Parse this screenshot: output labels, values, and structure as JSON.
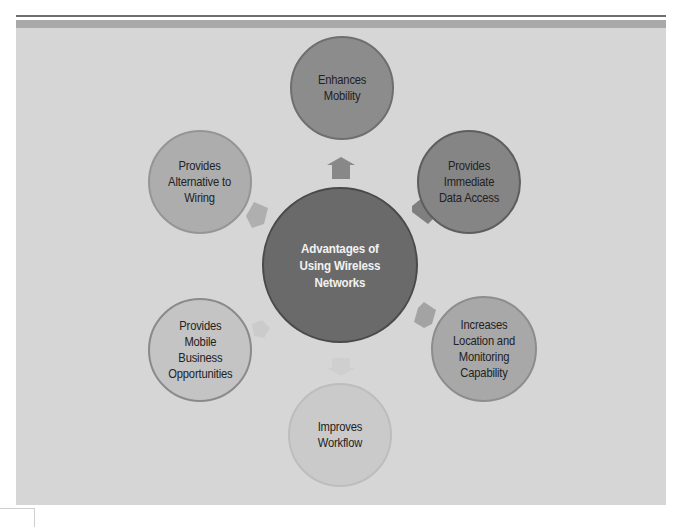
{
  "diagram": {
    "type": "hub-and-spoke",
    "center": {
      "label": "Advantages of Using Wireless Networks",
      "lines": [
        "Advantages of",
        "Using Wireless",
        "Networks"
      ],
      "fill": "#6a6a6a",
      "border": "#4a4a4a"
    },
    "nodes": [
      {
        "position": "top",
        "lines": [
          "Enhances",
          "Mobility"
        ],
        "fill": "#8c8c8c",
        "border": "#6f6f6f"
      },
      {
        "position": "top-right",
        "lines": [
          "Provides",
          "Immediate",
          "Data Access"
        ],
        "fill": "#858585",
        "border": "#5e5e5e"
      },
      {
        "position": "bottom-right",
        "lines": [
          "Increases",
          "Location and",
          "Monitoring",
          "Capability"
        ],
        "fill": "#a8a8a8",
        "border": "#8d8d8d"
      },
      {
        "position": "bottom",
        "lines": [
          "Improves",
          "Workflow"
        ],
        "fill": "#cacaca",
        "border": "#bdbdbd"
      },
      {
        "position": "bottom-left",
        "lines": [
          "Provides",
          "Mobile",
          "Business",
          "Opportunities"
        ],
        "fill": "#c4c4c4",
        "border": "#8a8a8a"
      },
      {
        "position": "top-left",
        "lines": [
          "Provides",
          "Alternative to",
          "Wiring"
        ],
        "fill": "#adadad",
        "border": "#959595"
      }
    ],
    "arrows": [
      {
        "direction": "up",
        "color": "#888888"
      },
      {
        "direction": "up-right",
        "color": "#8a8a8a"
      },
      {
        "direction": "down-right",
        "color": "#a3a3a3"
      },
      {
        "direction": "down",
        "color": "#cfcfcf"
      },
      {
        "direction": "down-left",
        "color": "#c9c9c9"
      },
      {
        "direction": "up-left",
        "color": "#b0b0b0"
      }
    ],
    "colors": {
      "panel": "#d6d6d6",
      "top_rule": "#6e6e6e",
      "top_band": "#a9a9a9",
      "center_text": "#f2f2f2",
      "node_text": "#222222"
    }
  }
}
